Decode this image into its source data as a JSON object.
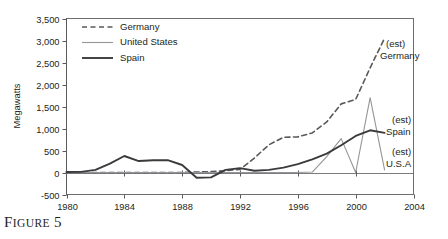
{
  "figure": {
    "caption_prefix": "F",
    "caption_word_rest": "IGURE",
    "caption_number": "5",
    "caption_full": "FIGURE 5"
  },
  "chart_data": {
    "type": "line",
    "title": "",
    "xlabel": "",
    "ylabel": "Megawatts",
    "xlim": [
      1980,
      2004
    ],
    "ylim": [
      -500,
      3500
    ],
    "xticks": [
      1980,
      1984,
      1988,
      1992,
      1996,
      2000,
      2004
    ],
    "xtick_labels": [
      "1980",
      "1984",
      "1988",
      "1992",
      "1996",
      "2000",
      "2004"
    ],
    "yticks": [
      -500,
      0,
      500,
      1000,
      1500,
      2000,
      2500,
      3000,
      3500
    ],
    "ytick_labels": [
      "-500",
      "0",
      "500",
      "1,000",
      "1,500",
      "2,000",
      "2,500",
      "3,000",
      "3,500"
    ],
    "grid": false,
    "legend_position": "top-left",
    "zero_line": true,
    "x": [
      1980,
      1981,
      1982,
      1983,
      1984,
      1985,
      1986,
      1987,
      1988,
      1989,
      1990,
      1991,
      1992,
      1993,
      1994,
      1995,
      1996,
      1997,
      1998,
      1999,
      2000,
      2001,
      2002
    ],
    "series": [
      {
        "name": "Germany",
        "style": "dashed",
        "color": "#58595b",
        "width": 1.6,
        "annotation": "(est)\nGermany",
        "annotation_line1": "(est)",
        "annotation_line2": "Germany",
        "values": [
          0,
          0,
          0,
          0,
          0,
          0,
          0,
          0,
          0,
          10,
          20,
          40,
          70,
          330,
          630,
          800,
          810,
          900,
          1150,
          1560,
          1660,
          2380,
          3050
        ]
      },
      {
        "name": "United States",
        "style": "solid",
        "color": "#939598",
        "width": 1.1,
        "annotation": "(est)\nU.S.A",
        "annotation_line1": "(est)",
        "annotation_line2": "U.S.A",
        "values": [
          0,
          0,
          0,
          0,
          0,
          0,
          0,
          0,
          0,
          0,
          0,
          0,
          0,
          0,
          0,
          0,
          0,
          10,
          360,
          770,
          0,
          1700,
          60
        ]
      },
      {
        "name": "Spain",
        "style": "solid",
        "color": "#3b3b3d",
        "width": 1.9,
        "annotation": "(est)\nSpain",
        "annotation_line1": "(est)",
        "annotation_line2": "Spain",
        "values": [
          10,
          15,
          60,
          200,
          375,
          260,
          280,
          280,
          170,
          -120,
          -110,
          60,
          100,
          40,
          60,
          110,
          190,
          300,
          430,
          620,
          830,
          960,
          900
        ]
      }
    ],
    "legend_entries": [
      {
        "label": "Germany",
        "style": "dashed",
        "color": "#58595b",
        "width": 1.6
      },
      {
        "label": "United States",
        "style": "solid",
        "color": "#939598",
        "width": 1.1
      },
      {
        "label": "Spain",
        "style": "solid",
        "color": "#3b3b3d",
        "width": 1.9
      }
    ]
  }
}
